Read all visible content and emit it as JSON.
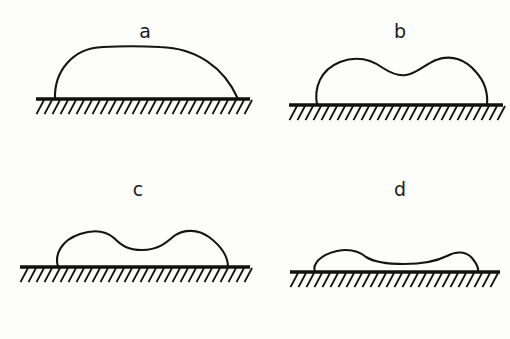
{
  "figure": {
    "background_color": "#fdfdfc",
    "ink_color": "#141414",
    "width": 510,
    "height": 339
  },
  "chart_data": {
    "type": "diagram",
    "xlabel": "",
    "ylabel": "",
    "grid": false,
    "legend": null,
    "panels": [
      {
        "label": "a",
        "label_x": 145,
        "label_y": 38,
        "baseline_y": 99,
        "baseline_x_start": 36,
        "baseline_x_end": 250,
        "contact_left": 55,
        "contact_right": 238,
        "apex_y": 47,
        "height": 52,
        "width": 183,
        "aspect_ratio": 0.28,
        "profile": "single smooth dome",
        "humps": 1,
        "center_dip": 0,
        "outline_path": "M 55 99 C 54 72 72 48 103 47 C 122 46 140 46 160 47 C 196 48 224 67 238 99",
        "hatch_count": 26
      },
      {
        "label": "b",
        "label_x": 400,
        "label_y": 38,
        "baseline_y": 105,
        "baseline_x_start": 289,
        "baseline_x_end": 503,
        "contact_left": 317,
        "contact_right": 487,
        "apex_y": 58,
        "height": 47,
        "width": 170,
        "aspect_ratio": 0.28,
        "profile": "broad dome with shallow central dip",
        "humps": 2,
        "center_dip": 6,
        "outline_path": "M 317 105 C 314 88 320 70 340 62 C 358 55 372 60 383 68 C 392 74 398 76 406 75 C 416 74 424 65 436 60 C 452 54 466 60 476 72 C 485 82 488 94 487 105",
        "hatch_count": 26
      },
      {
        "label": "c",
        "label_x": 138,
        "label_y": 196,
        "baseline_y": 267,
        "baseline_x_start": 20,
        "baseline_x_end": 250,
        "contact_left": 58,
        "contact_right": 228,
        "apex_y": 230,
        "height": 37,
        "width": 170,
        "aspect_ratio": 0.22,
        "profile": "flattened with two pronounced humps",
        "humps": 2,
        "center_dip": 14,
        "outline_path": "M 58 267 C 54 254 62 240 80 234 C 95 229 106 231 114 238 C 122 246 128 250 142 250 C 158 250 166 243 174 236 C 184 229 198 229 209 237 C 221 246 228 256 228 267",
        "hatch_count": 28
      },
      {
        "label": "d",
        "label_x": 400,
        "label_y": 196,
        "baseline_y": 272,
        "baseline_x_start": 290,
        "baseline_x_end": 500,
        "contact_left": 315,
        "contact_right": 478,
        "apex_y": 250,
        "height": 22,
        "width": 163,
        "aspect_ratio": 0.13,
        "profile": "nearly flat pancake with slight edge ridges",
        "humps": 2,
        "center_dip": 8,
        "outline_path": "M 315 272 C 312 264 320 255 337 251 C 352 248 360 252 366 257 C 374 262 390 264 404 264 C 420 264 437 261 447 256 C 456 251 466 251 472 258 C 477 264 479 268 478 272",
        "hatch_count": 27
      }
    ],
    "hatch_style": {
      "spacing": 8,
      "length": 16,
      "angle_deg": 62,
      "direction": "down-left",
      "color": "#161616"
    }
  },
  "labels": {
    "a": "a",
    "b": "b",
    "c": "c",
    "d": "d"
  }
}
